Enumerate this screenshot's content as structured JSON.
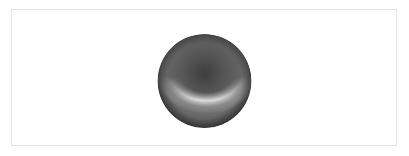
{
  "canvas": {
    "background": "#ffffff",
    "frame_border_color": "#e2e2e2"
  },
  "sphere": {
    "icon": "shaded-sphere",
    "base_color": "#5a5a5a",
    "dark_center_color": "#3c3c3c",
    "highlight_color": "#e6e6e6",
    "rim_color": "#4a4a4a"
  }
}
